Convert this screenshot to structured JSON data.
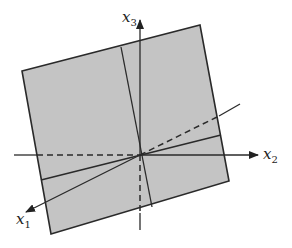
{
  "diagram": {
    "type": "3d-coordinate-plane",
    "colors": {
      "plane_fill": "#c4c4c4",
      "stroke": "#2a2a2a",
      "background": "#ffffff"
    },
    "axes": [
      {
        "id": "x1",
        "base": "x",
        "subscript": "1",
        "direction": "down-left"
      },
      {
        "id": "x2",
        "base": "x",
        "subscript": "2",
        "direction": "right"
      },
      {
        "id": "x3",
        "base": "x",
        "subscript": "3",
        "direction": "up"
      }
    ],
    "plane": {
      "corners": [
        [
          22,
          71
        ],
        [
          200,
          25
        ],
        [
          229,
          181
        ],
        [
          51,
          234
        ]
      ],
      "inner_lines": [
        "vertical-like line through origin",
        "horizontal-like line through origin"
      ]
    },
    "hidden_segments": "dashed"
  }
}
